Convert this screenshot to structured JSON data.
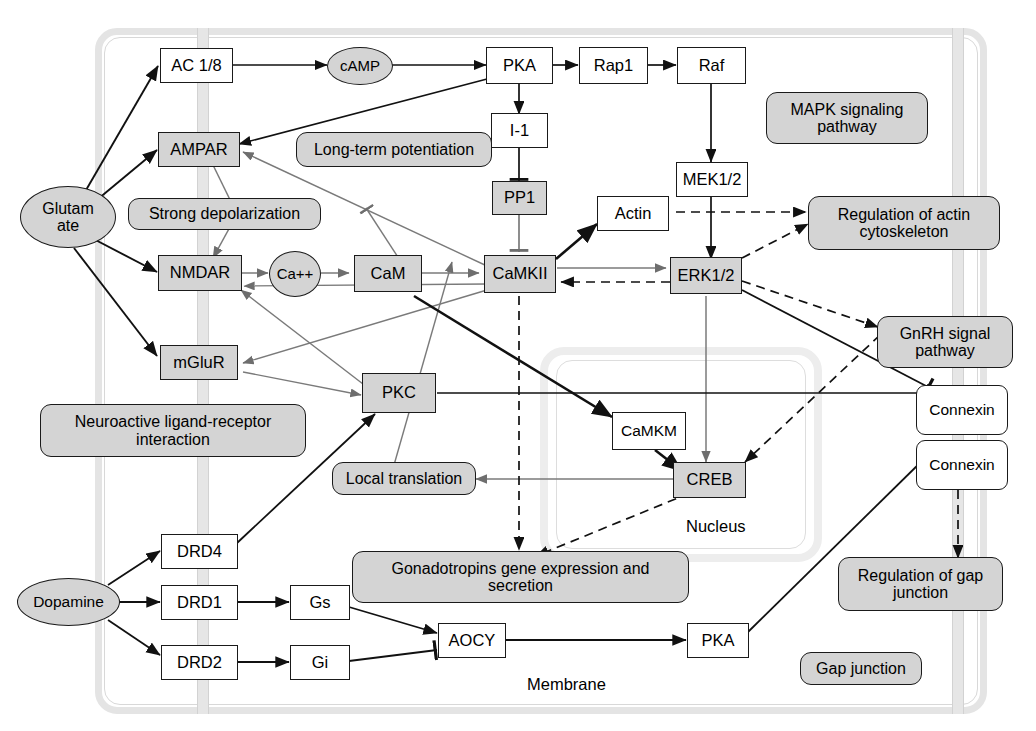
{
  "diagram": {
    "compartments": {
      "membrane_label": "Membrane",
      "nucleus_label": "Nucleus"
    },
    "colors": {
      "shaded_node": "#d4d4d4",
      "plain_node": "#ffffff",
      "outline": "#1a1a1a",
      "membrane": "#e6e6e6",
      "compartment": "#e4e4e4"
    }
  },
  "nodes": {
    "glutamate": "Glutam\nate",
    "glutamate_line1": "Glutam",
    "glutamate_line2": "ate",
    "dopamine": "Dopamine",
    "ac18": "AC 1/8",
    "ampar": "AMPAR",
    "nmdar": "NMDAR",
    "mglur": "mGluR",
    "camp": "cAMP",
    "ca": "Ca++",
    "cam": "CaM",
    "pka_top": "PKA",
    "rap1": "Rap1",
    "raf": "Raf",
    "i1": "I-1",
    "pp1": "PP1",
    "mek12": "MEK1/2",
    "actin": "Actin",
    "camkii": "CaMKII",
    "erk12": "ERK1/2",
    "pkc": "PKC",
    "camkm": "CaMKM",
    "creb": "CREB",
    "drd4": "DRD4",
    "drd1": "DRD1",
    "drd2": "DRD2",
    "gs": "Gs",
    "gi": "Gi",
    "aocy": "AOCY",
    "pka_bottom": "PKA",
    "connexin_top": "Connexin",
    "connexin_bottom": "Connexin"
  },
  "annotations": {
    "long_term_potentiation": "Long-term potentiation",
    "strong_depolarization": "Strong depolarization",
    "neuroactive": "Neuroactive ligand-receptor\ninteraction",
    "neuroactive_line1": "Neuroactive ligand-receptor",
    "neuroactive_line2": "interaction",
    "mapk": "MAPK signaling\npathway",
    "mapk_line1": "MAPK signaling",
    "mapk_line2": "pathway",
    "reg_actin": "Regulation of actin\ncytoskeleton",
    "reg_actin_line1": "Regulation of actin",
    "reg_actin_line2": "cytoskeleton",
    "gnrh": "GnRH signal\npathway",
    "gnrh_line1": "GnRH signal",
    "gnrh_line2": "pathway",
    "local_translation": "Local translation",
    "gonadotropins": "Gonadotropins gene expression and\nsecretion",
    "gonadotropins_line1": "Gonadotropins gene expression and",
    "gonadotropins_line2": "secretion",
    "reg_gap": "Regulation of gap\njunction",
    "reg_gap_line1": "Regulation of gap",
    "reg_gap_line2": "junction",
    "gap_junction": "Gap junction"
  },
  "edges": [
    {
      "from": "glutamate",
      "to": "ac18",
      "kind": "activation-solid-black"
    },
    {
      "from": "glutamate",
      "to": "ampar",
      "kind": "activation-solid-black"
    },
    {
      "from": "glutamate",
      "to": "nmdar",
      "kind": "activation-solid-black"
    },
    {
      "from": "glutamate",
      "to": "mglur",
      "kind": "activation-solid-black"
    },
    {
      "from": "ac18",
      "to": "camp",
      "kind": "activation-solid-black"
    },
    {
      "from": "camp",
      "to": "pka_top",
      "kind": "activation-solid-black"
    },
    {
      "from": "pka_top",
      "to": "ampar",
      "kind": "activation-solid-black"
    },
    {
      "from": "pka_top",
      "to": "i1",
      "kind": "activation-solid-black"
    },
    {
      "from": "pka_top",
      "to": "rap1",
      "kind": "activation-solid-black"
    },
    {
      "from": "rap1",
      "to": "raf",
      "kind": "activation-solid-black"
    },
    {
      "from": "raf",
      "to": "mek12",
      "kind": "activation-solid-black"
    },
    {
      "from": "mek12",
      "to": "erk12",
      "kind": "activation-solid-black"
    },
    {
      "from": "i1",
      "to": "pp1",
      "kind": "inhibition-solid-black"
    },
    {
      "from": "pp1",
      "to": "camkii",
      "kind": "inhibition-gray"
    },
    {
      "from": "ampar",
      "to": "nmdar",
      "kind": "activation-gray"
    },
    {
      "from": "nmdar",
      "to": "ca",
      "kind": "activation-gray"
    },
    {
      "from": "ca",
      "to": "cam",
      "kind": "activation-gray"
    },
    {
      "from": "cam",
      "to": "camkii",
      "kind": "activation-gray"
    },
    {
      "from": "camkii",
      "to": "actin",
      "kind": "activation-solid-black"
    },
    {
      "from": "camkii",
      "to": "erk12",
      "kind": "activation-gray"
    },
    {
      "from": "erk12",
      "to": "camkii",
      "kind": "activation-dashed"
    },
    {
      "from": "camkii",
      "to": "ampar",
      "kind": "activation-gray"
    },
    {
      "from": "camkii",
      "to": "nmdar",
      "kind": "activation-gray"
    },
    {
      "from": "camkii",
      "to": "mglur",
      "kind": "activation-gray"
    },
    {
      "from": "camkii",
      "to": "camkm",
      "kind": "activation-solid-black"
    },
    {
      "from": "camkm",
      "to": "creb",
      "kind": "activation-solid-black"
    },
    {
      "from": "erk12",
      "to": "creb",
      "kind": "activation-gray"
    },
    {
      "from": "erk12",
      "to": "reg_actin",
      "kind": "activation-dashed"
    },
    {
      "from": "actin",
      "to": "reg_actin",
      "kind": "activation-dashed"
    },
    {
      "from": "erk12",
      "to": "gnrh",
      "kind": "activation-dashed"
    },
    {
      "from": "gnrh",
      "to": "creb",
      "kind": "activation-dashed"
    },
    {
      "from": "erk12",
      "to": "connexin_top",
      "kind": "activation-solid-black"
    },
    {
      "from": "pkc",
      "to": "connexin_top",
      "kind": "inhibition-solid-black"
    },
    {
      "from": "pkc",
      "to": "nmdar",
      "kind": "activation-gray"
    },
    {
      "from": "mglur",
      "to": "pkc",
      "kind": "activation-gray"
    },
    {
      "from": "pkc",
      "to": "local_translation",
      "kind": "activation-gray"
    },
    {
      "from": "creb",
      "to": "local_translation",
      "kind": "activation-gray"
    },
    {
      "from": "creb",
      "to": "gonadotropins",
      "kind": "activation-dashed"
    },
    {
      "from": "camkii",
      "to": "gonadotropins",
      "kind": "activation-dashed"
    },
    {
      "from": "drd4",
      "to": "pkc",
      "kind": "activation-solid-black"
    },
    {
      "from": "dopamine",
      "to": "drd4",
      "kind": "activation-solid-black"
    },
    {
      "from": "dopamine",
      "to": "drd1",
      "kind": "activation-solid-black"
    },
    {
      "from": "dopamine",
      "to": "drd2",
      "kind": "activation-solid-black"
    },
    {
      "from": "drd1",
      "to": "gs",
      "kind": "activation-solid-black"
    },
    {
      "from": "drd2",
      "to": "gi",
      "kind": "activation-solid-black"
    },
    {
      "from": "gs",
      "to": "aocy",
      "kind": "activation-solid-black"
    },
    {
      "from": "gi",
      "to": "aocy",
      "kind": "inhibition-solid-black"
    },
    {
      "from": "aocy",
      "to": "pka_bottom",
      "kind": "activation-solid-black"
    },
    {
      "from": "pka_bottom",
      "to": "connexin_bottom",
      "kind": "activation-solid-black"
    },
    {
      "from": "connexin_bottom",
      "to": "reg_gap",
      "kind": "activation-dashed"
    }
  ]
}
